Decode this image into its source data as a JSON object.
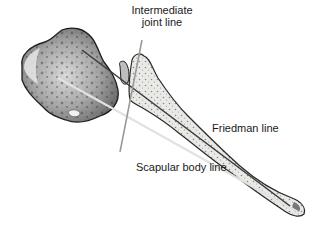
{
  "figure": {
    "labels": {
      "intermediate_joint_line": "Intermediate\njoint line",
      "intermediate_line1": "Intermediate",
      "intermediate_line2": "joint line",
      "friedman_line": "Friedman line",
      "scapular_body_line": "Scapular body line"
    },
    "colors": {
      "background": "#ffffff",
      "text": "#1a1a1a",
      "bone_outline": "#2a2a2a",
      "friedman_line": "#3a3a3a",
      "scapular_body_line": "#d8d8d8",
      "intermediate_joint_line": "#9a9a9a"
    }
  }
}
